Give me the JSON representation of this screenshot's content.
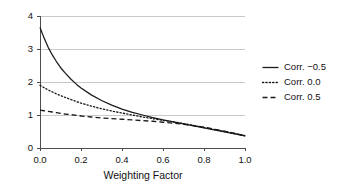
{
  "chart_data": {
    "type": "line",
    "title": "",
    "xlabel": "Weighting Factor",
    "ylabel": "",
    "xlim": [
      0.0,
      1.0
    ],
    "ylim": [
      0,
      4
    ],
    "grid": "horizontal",
    "legend_position": "right",
    "x_ticks": [
      "0.0",
      "0.2",
      "0.4",
      "0.6",
      "0.8",
      "1.0"
    ],
    "x_tick_values": [
      0.0,
      0.2,
      0.4,
      0.6,
      0.8,
      1.0
    ],
    "y_ticks": [
      "0",
      "1",
      "2",
      "3",
      "4"
    ],
    "y_tick_values": [
      0,
      1,
      2,
      3,
      4
    ],
    "x": [
      0.0,
      0.02,
      0.04,
      0.06,
      0.08,
      0.1,
      0.12,
      0.15,
      0.18,
      0.2,
      0.25,
      0.3,
      0.35,
      0.4,
      0.45,
      0.5,
      0.55,
      0.6,
      0.65,
      0.7,
      0.75,
      0.8,
      0.85,
      0.9,
      0.95,
      1.0
    ],
    "series": [
      {
        "name": "Corr. −0.5",
        "style": "solid",
        "color": "#1a1a1a",
        "values": [
          3.65,
          3.33,
          3.05,
          2.82,
          2.62,
          2.44,
          2.29,
          2.09,
          1.92,
          1.82,
          1.61,
          1.44,
          1.3,
          1.18,
          1.08,
          1.0,
          0.92,
          0.85,
          0.79,
          0.73,
          0.67,
          0.61,
          0.55,
          0.49,
          0.43,
          0.37
        ]
      },
      {
        "name": "Corr. 0.0",
        "style": "dotted",
        "color": "#1a1a1a",
        "values": [
          1.9,
          1.83,
          1.76,
          1.7,
          1.64,
          1.59,
          1.54,
          1.47,
          1.4,
          1.36,
          1.27,
          1.19,
          1.12,
          1.06,
          1.0,
          0.94,
          0.89,
          0.84,
          0.79,
          0.74,
          0.68,
          0.62,
          0.56,
          0.5,
          0.44,
          0.37
        ]
      },
      {
        "name": "Corr. 0.5",
        "style": "dashed",
        "color": "#1a1a1a",
        "values": [
          1.15,
          1.13,
          1.11,
          1.09,
          1.07,
          1.05,
          1.03,
          1.01,
          0.99,
          0.97,
          0.94,
          0.91,
          0.89,
          0.87,
          0.85,
          0.83,
          0.81,
          0.78,
          0.75,
          0.72,
          0.68,
          0.63,
          0.57,
          0.51,
          0.44,
          0.37
        ]
      }
    ],
    "legend": [
      {
        "label": "Corr. −0.5",
        "style": "solid"
      },
      {
        "label": "Corr. 0.0",
        "style": "dotted"
      },
      {
        "label": "Corr. 0.5",
        "style": "dashed"
      }
    ],
    "colors": {
      "axis": "#4d4d4d",
      "grid": "#c9c9c9",
      "line": "#1a1a1a",
      "text": "#111111",
      "background": "#ffffff"
    }
  }
}
